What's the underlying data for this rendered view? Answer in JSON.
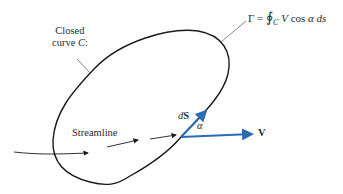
{
  "diagram": {
    "labels": {
      "closed_curve_line1": "Closed",
      "closed_curve_line2_prefix": "curve ",
      "closed_curve_var": "C",
      "closed_curve_suffix": ":",
      "streamline": "Streamline",
      "ds_prefix": "d",
      "ds_vec": "S",
      "alpha": "α",
      "velocity": "V",
      "equation_gamma": "Γ = ",
      "equation_integral": "∮",
      "equation_sub": "C",
      "equation_body_V": " V",
      "equation_cos": " cos ",
      "equation_alpha": "α",
      "equation_ds": " ds"
    },
    "colors": {
      "curve": "#1a1a1a",
      "leader": "#666666",
      "vector": "#2a6db5",
      "text": "#2a2a2a"
    }
  }
}
